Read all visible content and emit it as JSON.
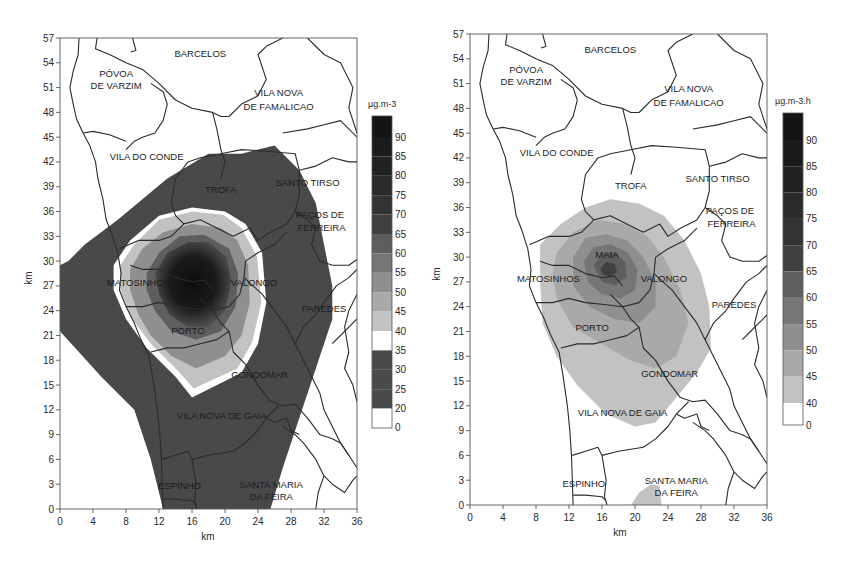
{
  "figure": {
    "panels": [
      {
        "id": "left",
        "unit_label": "µg.m-3",
        "xlabel": "km",
        "ylabel": "km",
        "x_ticks": [
          0,
          4,
          8,
          12,
          16,
          20,
          24,
          28,
          32,
          36
        ],
        "y_ticks": [
          0,
          3,
          6,
          9,
          12,
          15,
          18,
          21,
          24,
          27,
          30,
          33,
          36,
          39,
          42,
          45,
          48,
          51,
          54,
          57
        ],
        "colorbar": {
          "labels": [
            "90",
            "85",
            "80",
            "75",
            "70",
            "65",
            "60",
            "55",
            "50",
            "45",
            "40",
            "35",
            "30",
            "25",
            "20",
            "0"
          ]
        },
        "places": [
          {
            "name": "BARCELOS",
            "x": 17,
            "y": 55.1
          },
          {
            "name": "PÓVOA",
            "x": 6.8,
            "y": 52.7
          },
          {
            "name": "DE VARZIM",
            "x": 6.8,
            "y": 51.2
          },
          {
            "name": "VILA NOVA",
            "x": 26.5,
            "y": 50.3
          },
          {
            "name": "DE FAMALICAO",
            "x": 26.5,
            "y": 48.7
          },
          {
            "name": "VILA DO CONDE",
            "x": 10.5,
            "y": 42.6
          },
          {
            "name": "TROFA",
            "x": 19.5,
            "y": 38.6
          },
          {
            "name": "SANTO TIRSO",
            "x": 30,
            "y": 39.4
          },
          {
            "name": "PAÇOS DE",
            "x": 31.5,
            "y": 35.6
          },
          {
            "name": "FERREIRA",
            "x": 31.7,
            "y": 34.0
          },
          {
            "name": "MATOSINHOS",
            "x": 9.5,
            "y": 27.3
          },
          {
            "name": "VALONGO",
            "x": 23.5,
            "y": 27.3
          },
          {
            "name": "PAREDES",
            "x": 32,
            "y": 24.2
          },
          {
            "name": "PORTO",
            "x": 15.5,
            "y": 21.5
          },
          {
            "name": "GONDOMAR",
            "x": 24.2,
            "y": 16.2
          },
          {
            "name": "VILA NOVA DE GAIA",
            "x": 19.6,
            "y": 11.3
          },
          {
            "name": "ESPINHO",
            "x": 14.5,
            "y": 2.8
          },
          {
            "name": "SANTA MARIA",
            "x": 25.6,
            "y": 2.9
          },
          {
            "name": "DA FEIRA",
            "x": 25.6,
            "y": 1.4
          }
        ]
      },
      {
        "id": "right",
        "unit_label": "µg.m-3.h",
        "xlabel": "km",
        "ylabel": "km",
        "x_ticks": [
          0,
          4,
          8,
          12,
          16,
          20,
          24,
          28,
          32,
          36
        ],
        "y_ticks": [
          0,
          3,
          6,
          9,
          12,
          15,
          18,
          21,
          24,
          27,
          30,
          33,
          36,
          39,
          42,
          45,
          48,
          51,
          54,
          57
        ],
        "colorbar": {
          "labels": [
            "90",
            "85",
            "80",
            "75",
            "70",
            "65",
            "60",
            "55",
            "50",
            "45",
            "40",
            "0"
          ]
        },
        "places": [
          {
            "name": "BARCELOS",
            "x": 17,
            "y": 55.1
          },
          {
            "name": "PÓVOA",
            "x": 6.8,
            "y": 52.7
          },
          {
            "name": "DE VARZIM",
            "x": 6.8,
            "y": 51.2
          },
          {
            "name": "VILA NOVA",
            "x": 26.5,
            "y": 50.3
          },
          {
            "name": "DE FAMALICAO",
            "x": 26.5,
            "y": 48.7
          },
          {
            "name": "VILA DO CONDE",
            "x": 10.5,
            "y": 42.6
          },
          {
            "name": "TROFA",
            "x": 19.5,
            "y": 38.6
          },
          {
            "name": "SANTO TIRSO",
            "x": 30,
            "y": 39.4
          },
          {
            "name": "PAÇOS DE",
            "x": 31.5,
            "y": 35.6
          },
          {
            "name": "FERREIRA",
            "x": 31.7,
            "y": 34.0
          },
          {
            "name": "MAIA",
            "x": 16.6,
            "y": 30.2
          },
          {
            "name": "MATOSINHOS",
            "x": 9.5,
            "y": 27.3
          },
          {
            "name": "VALONGO",
            "x": 23.5,
            "y": 27.3
          },
          {
            "name": "PAREDES",
            "x": 32,
            "y": 24.2
          },
          {
            "name": "PORTO",
            "x": 14.8,
            "y": 21.4
          },
          {
            "name": "GONDOMAR",
            "x": 24.2,
            "y": 15.8
          },
          {
            "name": "VILA NOVA DE GAIA",
            "x": 18.5,
            "y": 11.1
          },
          {
            "name": "ESPINHO",
            "x": 13.8,
            "y": 2.6
          },
          {
            "name": "SANTA MARIA",
            "x": 25,
            "y": 2.9
          },
          {
            "name": "DA FEIRA",
            "x": 25,
            "y": 1.4
          }
        ]
      }
    ]
  },
  "chart_data": [
    {
      "type": "heatmap",
      "title": "",
      "xlabel": "km",
      "ylabel": "km",
      "xlim": [
        0,
        36
      ],
      "ylim": [
        0,
        57
      ],
      "grid": false,
      "legend_position": "right (colorbar)",
      "colorbar_unit": "µg.m-3",
      "colorbar_levels": [
        0,
        20,
        25,
        30,
        35,
        40,
        45,
        50,
        55,
        60,
        65,
        70,
        75,
        80,
        85,
        90
      ],
      "description": "Concentration contour map over the Porto region. Outer plume (20-35 µg.m-3, dark) extends from coast near y=21-30 km NE to ~x=26,y=44 and south to y=0 between x~12-25. White band 35-40 ring around core. Core maximum (>65-90) centered near x=16, y=28 (Maia/Matosinhos/Porto).",
      "contours": [
        {
          "level": "20-35",
          "polygon": [
            [
              0,
              29.5
            ],
            [
              0,
              21.5
            ],
            [
              5,
              16
            ],
            [
              9,
              12
            ],
            [
              11,
              6
            ],
            [
              12.5,
              0
            ],
            [
              25.5,
              0
            ],
            [
              27,
              5
            ],
            [
              29,
              11
            ],
            [
              31,
              17
            ],
            [
              33,
              23
            ],
            [
              33,
              27
            ],
            [
              32,
              32
            ],
            [
              31,
              37
            ],
            [
              29,
              41
            ],
            [
              26,
              44
            ],
            [
              22,
              43
            ],
            [
              18,
              43
            ],
            [
              13,
              40
            ],
            [
              7,
              35
            ],
            [
              3,
              32
            ],
            [
              1,
              30
            ]
          ]
        },
        {
          "level": "35-40",
          "polygon": [
            [
              6.5,
              29.5
            ],
            [
              8.5,
              32.5
            ],
            [
              12,
              35.5
            ],
            [
              16,
              36.5
            ],
            [
              20,
              36
            ],
            [
              22.5,
              34.5
            ],
            [
              24.5,
              31
            ],
            [
              25,
              25
            ],
            [
              24,
              20
            ],
            [
              22,
              16.5
            ],
            [
              16,
              13.5
            ],
            [
              14,
              16
            ],
            [
              10.5,
              19.5
            ],
            [
              8,
              23
            ],
            [
              6.5,
              26.5
            ]
          ]
        },
        {
          "level": "40-45",
          "polygon": [
            [
              7.3,
              29.5
            ],
            [
              9,
              32
            ],
            [
              12,
              35
            ],
            [
              16,
              36
            ],
            [
              19.8,
              35.6
            ],
            [
              22,
              34
            ],
            [
              23.9,
              30.5
            ],
            [
              24.4,
              25
            ],
            [
              23.3,
              20.2
            ],
            [
              21.5,
              17
            ],
            [
              16.2,
              14.6
            ],
            [
              14.4,
              16.6
            ],
            [
              11,
              20
            ],
            [
              8.6,
              23.2
            ],
            [
              7.3,
              26.5
            ]
          ]
        },
        {
          "level": "45-55",
          "polygon": [
            [
              8.5,
              29
            ],
            [
              10,
              31.5
            ],
            [
              12.5,
              33.5
            ],
            [
              16,
              34.5
            ],
            [
              19.5,
              34
            ],
            [
              21.5,
              32.5
            ],
            [
              22.8,
              29.5
            ],
            [
              23,
              25
            ],
            [
              22,
              21
            ],
            [
              20,
              18.5
            ],
            [
              16.5,
              17
            ],
            [
              13.5,
              18.5
            ],
            [
              11,
              21
            ],
            [
              9.5,
              23.5
            ],
            [
              8.5,
              26.5
            ]
          ]
        },
        {
          "level": "55-65",
          "polygon": [
            [
              10.5,
              28.5
            ],
            [
              12,
              31
            ],
            [
              14.5,
              33
            ],
            [
              17.5,
              33.2
            ],
            [
              20.5,
              31.5
            ],
            [
              21.6,
              28.5
            ],
            [
              21.3,
              24.5
            ],
            [
              19.5,
              21.5
            ],
            [
              16.5,
              20.5
            ],
            [
              13.5,
              21.5
            ],
            [
              11.5,
              24
            ],
            [
              10.5,
              26.5
            ]
          ]
        },
        {
          "level": ">65",
          "polygon": [
            [
              11.5,
              28.5
            ],
            [
              13,
              31
            ],
            [
              15.5,
              32.3
            ],
            [
              18,
              32.3
            ],
            [
              20.2,
              30.5
            ],
            [
              20.8,
              27.5
            ],
            [
              20,
              24
            ],
            [
              18,
              22
            ],
            [
              15.5,
              22
            ],
            [
              13.3,
              23.5
            ],
            [
              12,
              26
            ]
          ]
        }
      ]
    },
    {
      "type": "heatmap",
      "title": "",
      "xlabel": "km",
      "ylabel": "km",
      "xlim": [
        0,
        36
      ],
      "ylim": [
        0,
        57
      ],
      "grid": false,
      "legend_position": "right (colorbar)",
      "colorbar_unit": "µg.m-3.h",
      "colorbar_levels": [
        0,
        40,
        45,
        50,
        55,
        60,
        65,
        70,
        75,
        80,
        85,
        90
      ],
      "description": "Time-integrated dose map. Plume 40-45 extends from x~8 to x~29, y~9.5 to 37; maximum (~65-70) near Maia at x~16, y~28.5. Small 40-45 patch near Santa Maria da Feira at x~19.5-23, y~0-2.5.",
      "contours": [
        {
          "level": "40-45",
          "polygon": [
            [
              8.5,
              31.5
            ],
            [
              11,
              34
            ],
            [
              14,
              36
            ],
            [
              17,
              37
            ],
            [
              20.5,
              36.5
            ],
            [
              23.5,
              35
            ],
            [
              26,
              32
            ],
            [
              28,
              28
            ],
            [
              29,
              24
            ],
            [
              29.2,
              19
            ],
            [
              27.5,
              16
            ],
            [
              25,
              13
            ],
            [
              22.5,
              10
            ],
            [
              20,
              9.5
            ],
            [
              16.5,
              11
            ],
            [
              13,
              14.5
            ],
            [
              10.5,
              18
            ],
            [
              8.8,
              22
            ],
            [
              8.5,
              27
            ]
          ]
        },
        {
          "level": "40-45 (south patch)",
          "polygon": [
            [
              19.5,
              0
            ],
            [
              20.5,
              1.5
            ],
            [
              22,
              2.5
            ],
            [
              23,
              2.3
            ],
            [
              23.2,
              0
            ]
          ]
        },
        {
          "level": "45-50",
          "polygon": [
            [
              10.5,
              30.5
            ],
            [
              12.5,
              33
            ],
            [
              15.5,
              34.5
            ],
            [
              19,
              34
            ],
            [
              21.5,
              32.5
            ],
            [
              23.5,
              30
            ],
            [
              25.5,
              26
            ],
            [
              26.5,
              22
            ],
            [
              25,
              18
            ],
            [
              22.5,
              16.5
            ],
            [
              19.5,
              17.5
            ],
            [
              16,
              19.5
            ],
            [
              12.5,
              21.5
            ],
            [
              10.5,
              25
            ],
            [
              10,
              28
            ]
          ]
        },
        {
          "level": "50-55",
          "polygon": [
            [
              12.5,
              30
            ],
            [
              14,
              32.3
            ],
            [
              16.5,
              32.8
            ],
            [
              19,
              32
            ],
            [
              21,
              30
            ],
            [
              22.5,
              27
            ],
            [
              22.5,
              24
            ],
            [
              20.5,
              22
            ],
            [
              17.5,
              22.5
            ],
            [
              14.5,
              24
            ],
            [
              12.5,
              26.5
            ]
          ]
        },
        {
          "level": "55-60",
          "polygon": [
            [
              13.8,
              29.5
            ],
            [
              15,
              31.2
            ],
            [
              17,
              31.6
            ],
            [
              19.2,
              30.5
            ],
            [
              20.3,
              28.5
            ],
            [
              20,
              26
            ],
            [
              18.2,
              25
            ],
            [
              16,
              25.5
            ],
            [
              14.3,
              27
            ]
          ]
        },
        {
          "level": "60-65",
          "polygon": [
            [
              15,
              29
            ],
            [
              16,
              30.4
            ],
            [
              17.5,
              30.6
            ],
            [
              18.8,
              29.4
            ],
            [
              19,
              27.6
            ],
            [
              17.6,
              26.6
            ],
            [
              16,
              27
            ]
          ]
        },
        {
          "level": "65-70",
          "polygon": [
            [
              15.8,
              28.6
            ],
            [
              16.5,
              29.4
            ],
            [
              17.5,
              29.2
            ],
            [
              17.8,
              28.2
            ],
            [
              17,
              27.6
            ],
            [
              16.1,
              27.9
            ]
          ]
        }
      ]
    }
  ],
  "colors": {
    "background": "#ffffff",
    "border": "#2b2b2b",
    "level_0": "#ffffff",
    "level_20_35": "#4a4a4a",
    "level_35_40": "#ffffff",
    "level_40_45": "#c2c2c2",
    "level_45_50": "#a9a9a9",
    "level_50_55": "#8f8f8f",
    "level_55_60": "#767676",
    "level_60_65": "#5e5e5e",
    "level_65_70": "#404040",
    "level_70_75": "#333333",
    "level_75_80": "#2a2a2a",
    "level_80_85": "#222222",
    "level_85_90": "#1b1b1b",
    "level_90_plus": "#141414"
  }
}
